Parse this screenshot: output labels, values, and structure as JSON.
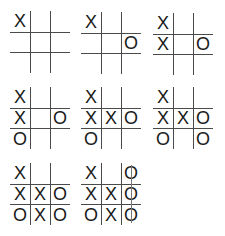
{
  "boards": [
    {
      "cells": [
        "X",
        "",
        "",
        "",
        "",
        "",
        "",
        "",
        ""
      ]
    },
    {
      "cells": [
        "X",
        "",
        "",
        "",
        "",
        "O",
        "",
        "",
        ""
      ]
    },
    {
      "cells": [
        "X",
        "",
        "",
        "X",
        "",
        "O",
        "",
        "",
        ""
      ]
    },
    {
      "cells": [
        "X",
        "",
        "",
        "X",
        "",
        "O",
        "O",
        "",
        ""
      ]
    },
    {
      "cells": [
        "X",
        "",
        "",
        "X",
        "X",
        "O",
        "O",
        "",
        ""
      ]
    },
    {
      "cells": [
        "X",
        "",
        "",
        "X",
        "X",
        "O",
        "O",
        "",
        "O"
      ]
    },
    {
      "cells": [
        "X",
        "",
        "",
        "X",
        "X",
        "O",
        "O",
        "X",
        "O"
      ]
    },
    {
      "cells": [
        "X",
        "",
        "O",
        "X",
        "X",
        "O",
        "O",
        "X",
        "O"
      ],
      "win_line": "right-column"
    }
  ],
  "colors": {
    "grid": "#4a4a4a",
    "mark": "#1a1a1a",
    "strike": "#777777"
  }
}
